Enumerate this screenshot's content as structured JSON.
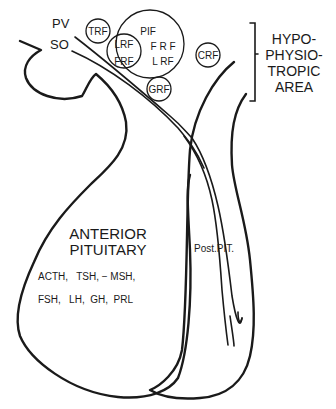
{
  "figure": {
    "type": "anatomical-schematic"
  },
  "nuclei": {
    "pv": "PV",
    "so": "SO"
  },
  "releasing_factors": {
    "trf": "TRF",
    "pif": "PIF",
    "lrf_inner": "LRF",
    "frf_inner": "FRF",
    "frf_outer": "F R F",
    "lrf_outer": "L RF",
    "grf": "GRF",
    "crf": "CRF"
  },
  "hypophysiotropic_area": {
    "lines": [
      "HYPO-",
      "PHYSIO-",
      "TROPIC",
      "AREA"
    ]
  },
  "anterior_pituitary": {
    "title_line1": "ANTERIOR",
    "title_line2": "PITUITARY",
    "hormones_line1": "ACTH,   TSH, − MSH,",
    "hormones_line2": "FSH,   LH,  GH,  PRL"
  },
  "posterior_pituitary": {
    "label": "Post.PIT."
  },
  "colors": {
    "ink": "#1a1a1a",
    "background": "#ffffff"
  }
}
